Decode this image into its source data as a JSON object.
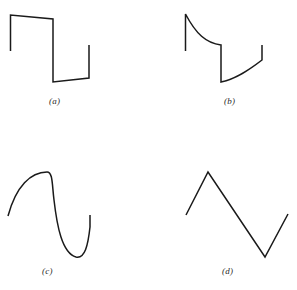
{
  "figure": {
    "background_color": "#ffffff",
    "stroke_color": "#1a1a1a",
    "stroke_width": 1.5,
    "width": 297,
    "height": 290
  },
  "panels": [
    {
      "id": "a",
      "caption": "(a)",
      "description": "square wave with sloping (drooping) flat tops and bottoms",
      "waveform_type": "square",
      "path": "M 10.5 51 L 10.5 15 L 53 19 L 53 82 L 89 78 L 89 45"
    },
    {
      "id": "b",
      "caption": "(b)",
      "description": "sawtooth wave with exponential decay and exponential recovery segments",
      "waveform_type": "exponential-sawtooth",
      "path": "M 185.5 51 L 185.5 14 C 196 34 206 43 221 45 L 221 82 C 236 79 249 70 262 60 L 262 45"
    },
    {
      "id": "c",
      "caption": "(c)",
      "description": "smooth sinusoidal curve with rounded peak and trough",
      "waveform_type": "sine",
      "path": "M 8 216 C 16 186 31 172 47 172 C 53 172 52 185 54 200 C 57 226 62 253 76 257 C 85 259 88 245 90 227 L 90 215"
    },
    {
      "id": "d",
      "caption": "(d)",
      "description": "triangular wave with sharp apex and sharp valley",
      "waveform_type": "triangle",
      "path": "M 186 215 L 208 172 L 265 257 L 288 214"
    }
  ],
  "captions": {
    "a": "(a)",
    "b": "(b)",
    "c": "(c)",
    "d": "(d)"
  }
}
